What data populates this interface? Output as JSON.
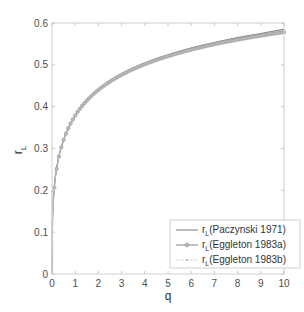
{
  "chart_data": {
    "type": "line",
    "title": "",
    "xlabel": "q",
    "ylabel": "r_L",
    "ylabel_main": "r",
    "ylabel_sub": "L",
    "xlim": [
      0,
      10
    ],
    "ylim": [
      0,
      0.6
    ],
    "x_ticks": [
      0,
      1,
      2,
      3,
      4,
      5,
      6,
      7,
      8,
      9,
      10
    ],
    "x_tick_labels": [
      "0",
      "1",
      "2",
      "3",
      "4",
      "5",
      "6",
      "7",
      "8",
      "9",
      "10"
    ],
    "y_ticks": [
      0,
      0.1,
      0.2,
      0.3,
      0.4,
      0.5,
      0.6
    ],
    "y_tick_labels": [
      "0",
      "0.1",
      "0.2",
      "0.3",
      "0.4",
      "0.5",
      "0.6"
    ],
    "grid": false,
    "legend_position": "lower right",
    "x": [
      0.0,
      0.1,
      0.2,
      0.3,
      0.5,
      0.75,
      1,
      1.5,
      2,
      3,
      4,
      5,
      6,
      7,
      8,
      9,
      10
    ],
    "series": [
      {
        "name": "r_L(Paczynski 1971)",
        "legend_main": "r",
        "legend_sub": "L",
        "legend_rest": "(Paczynski 1971)",
        "color": "#8c8c8c",
        "style": "solid",
        "values": [
          0.0,
          0.21,
          0.253,
          0.282,
          0.32,
          0.352,
          0.378,
          0.414,
          0.44,
          0.478,
          0.504,
          0.524,
          0.54,
          0.553,
          0.565,
          0.575,
          0.585
        ]
      },
      {
        "name": "r_L(Eggleton 1983a)",
        "legend_main": "r",
        "legend_sub": "L",
        "legend_rest": "(Eggleton 1983a)",
        "color": "#9a9a9a",
        "style": "solid-circle-markers",
        "values": [
          0.0,
          0.207,
          0.252,
          0.281,
          0.321,
          0.354,
          0.379,
          0.415,
          0.44,
          0.476,
          0.501,
          0.521,
          0.536,
          0.549,
          0.56,
          0.57,
          0.578
        ]
      },
      {
        "name": "r_L(Eggleton 1983b)",
        "legend_main": "r",
        "legend_sub": "L",
        "legend_rest": "(Eggleton 1983b)",
        "color": "#c8c8c8",
        "style": "dotted-markers",
        "values": [
          0.0,
          0.207,
          0.252,
          0.281,
          0.321,
          0.354,
          0.379,
          0.415,
          0.44,
          0.476,
          0.501,
          0.521,
          0.536,
          0.549,
          0.56,
          0.57,
          0.578
        ]
      }
    ]
  }
}
